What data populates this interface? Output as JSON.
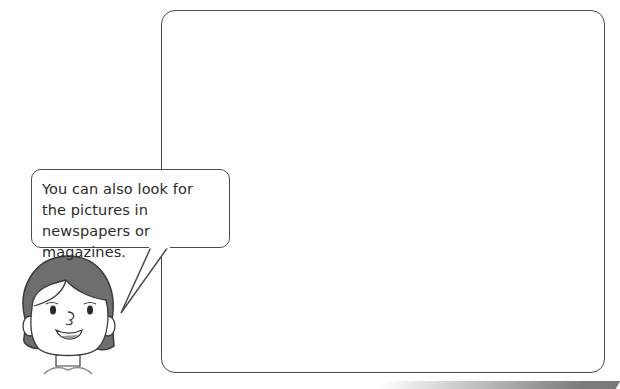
{
  "speech_bubble": {
    "text": "You can also look for the pictures in newspapers or magazines."
  },
  "answer_box": {
    "content": ""
  },
  "character": {
    "description": "girl with short dark hair, smiling"
  }
}
